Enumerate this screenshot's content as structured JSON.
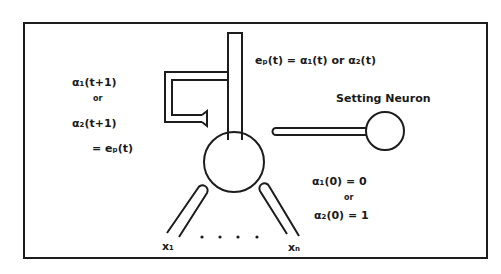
{
  "diagram": {
    "type": "neuron-schematic",
    "colors": {
      "ink": "#1c1c1c",
      "background": "#ffffff"
    },
    "labels": {
      "feedback_top": "α₁(t+1)",
      "feedback_or": "or",
      "feedback_mid": "α₂(t+1)",
      "feedback_eq": "= eₚ(t)",
      "output_eq": "eₚ(t) = α₁(t) or α₂(t)",
      "setting_neuron": "Setting Neuron",
      "init_top": "α₁(0) = 0",
      "init_or": "or",
      "init_bottom": "α₂(0) = 1",
      "input_first": "x₁",
      "input_last": "xₙ",
      "ellipsis": ". . . ."
    },
    "nodes": [
      {
        "id": "main-neuron",
        "role": "processing neuron"
      },
      {
        "id": "setting-neuron",
        "label": "Setting Neuron"
      }
    ],
    "inputs": [
      "x₁",
      "xₙ"
    ]
  }
}
